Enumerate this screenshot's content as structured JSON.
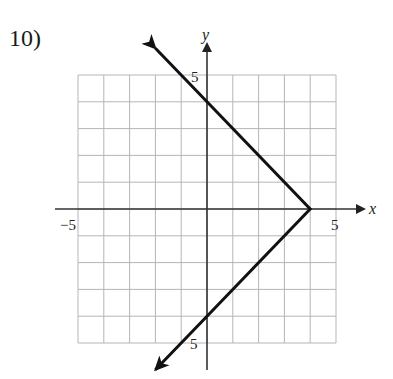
{
  "problem": {
    "number_label": "10)"
  },
  "chart_data": {
    "type": "line",
    "title": "",
    "xlabel": "x",
    "ylabel": "y",
    "xlim": [
      -5,
      5
    ],
    "ylim": [
      -5,
      5
    ],
    "grid": true,
    "grid_step": 1,
    "tick_labels": {
      "x_negative": "−5",
      "x_positive": "5",
      "y_positive": "5",
      "y_negative": "5"
    },
    "series": [
      {
        "name": "graph",
        "description": "V-shape opening left with vertex at (4, 0); arrows at both ends",
        "equation": "x = 4 - |y|",
        "points": [
          [
            -2,
            6
          ],
          [
            0,
            4
          ],
          [
            4,
            0
          ],
          [
            0,
            -4
          ],
          [
            -2,
            -6
          ]
        ],
        "vertex": [
          4,
          0
        ],
        "y_intercepts": [
          4,
          -4
        ],
        "arrows": true
      }
    ],
    "colors": {
      "grid": "#b5b5b5",
      "axes": "#333333",
      "curve": "#111111"
    }
  }
}
